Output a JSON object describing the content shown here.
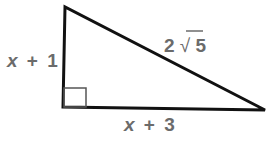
{
  "diagram": {
    "type": "right-triangle",
    "vertices": {
      "top": [
        65,
        7
      ],
      "right_angle": [
        63,
        107
      ],
      "right": [
        265,
        110
      ]
    },
    "labels": {
      "left_leg": {
        "var": "x",
        "op": "+",
        "num": "1"
      },
      "bottom_leg": {
        "var": "x",
        "op": "+",
        "num": "3"
      },
      "hypotenuse": {
        "coef": "2",
        "radical": "√",
        "radicand": "5"
      }
    },
    "right_angle_marker": true,
    "colors": {
      "stroke": "#111111",
      "marker": "#555555",
      "label": "#6b6b6b"
    }
  }
}
